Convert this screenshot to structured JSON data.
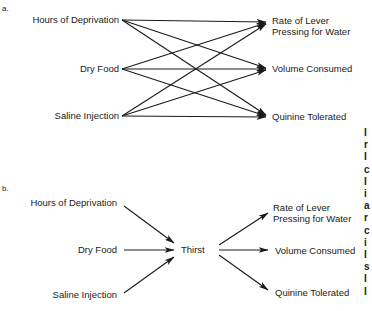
{
  "panel_a": {
    "tag": "a.",
    "inputs": [
      "Hours of Deprivation",
      "Dry Food",
      "Saline Injection"
    ],
    "outputs": [
      "Rate of Lever",
      "Pressing for Water",
      "Volume Consumed",
      "Quinine Tolerated"
    ]
  },
  "panel_b": {
    "tag": "b.",
    "inputs": [
      "Hours of Deprivation",
      "Dry Food",
      "Saline Injection"
    ],
    "intervening": "Thirst",
    "outputs": [
      "Rate of Lever",
      "Pressing for Water",
      "Volume Consumed",
      "Quinine Tolerated"
    ]
  },
  "clipped_edge_glyphs": [
    "I",
    "r",
    "I",
    "c",
    "I",
    "i",
    "a",
    "r",
    "c",
    "i",
    "I",
    "s",
    "I",
    "I"
  ]
}
